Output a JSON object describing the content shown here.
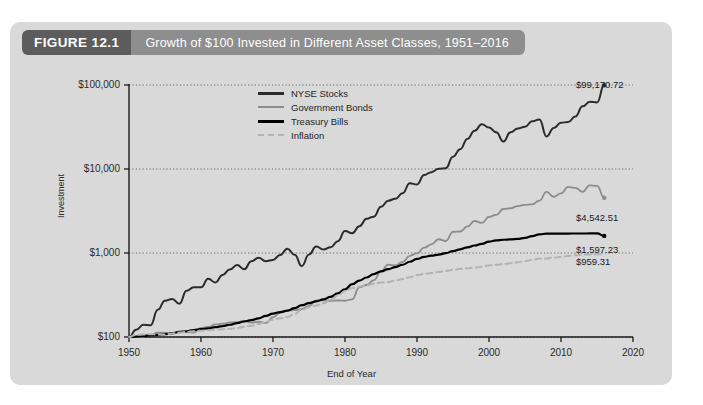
{
  "figure": {
    "number": "FIGURE 12.1",
    "title": "Growth of $100 Invested in Different Asset Classes, 1951–2016"
  },
  "chart_data": {
    "type": "line",
    "title": "Growth of $100 Invested in Different Asset Classes, 1951–2016",
    "xlabel": "End of Year",
    "ylabel": "Investment",
    "yscale": "log",
    "ylim": [
      100,
      100000
    ],
    "xlim": [
      1950,
      2020
    ],
    "grid": true,
    "legend_position": "upper-center",
    "y_ticks": [
      "$100",
      "$1,000",
      "$10,000",
      "$100,000"
    ],
    "y_tick_values": [
      100,
      1000,
      10000,
      100000
    ],
    "x_ticks": [
      "1950",
      "1960",
      "1970",
      "1980",
      "1990",
      "2000",
      "2010",
      "2020"
    ],
    "x_tick_values": [
      1950,
      1960,
      1970,
      1980,
      1990,
      2000,
      2010,
      2020
    ],
    "colors": {
      "nyse": "#2b2b2b",
      "bonds": "#8c8c8c",
      "bills": "#000000",
      "inflation": "#b3b3b3",
      "panel_background": "#d9d9d9",
      "header_number": "#5c5c5c",
      "header_title": "#8e8e8e"
    },
    "end_labels": [
      {
        "series": "NYSE Stocks",
        "text": "$99,170.72",
        "value": 99170.72
      },
      {
        "series": "Government Bonds",
        "text": "$4,542.51",
        "value": 4542.51
      },
      {
        "series": "Treasury Bills",
        "text": "$1,597.23",
        "value": 1597.23
      },
      {
        "series": "Inflation",
        "text": "$959.31",
        "value": 959.31
      }
    ],
    "x": [
      1950,
      1951,
      1952,
      1953,
      1954,
      1955,
      1956,
      1957,
      1958,
      1959,
      1960,
      1961,
      1962,
      1963,
      1964,
      1965,
      1966,
      1967,
      1968,
      1969,
      1970,
      1971,
      1972,
      1973,
      1974,
      1975,
      1976,
      1977,
      1978,
      1979,
      1980,
      1981,
      1982,
      1983,
      1984,
      1985,
      1986,
      1987,
      1988,
      1989,
      1990,
      1991,
      1992,
      1993,
      1994,
      1995,
      1996,
      1997,
      1998,
      1999,
      2000,
      2001,
      2002,
      2003,
      2004,
      2005,
      2006,
      2007,
      2008,
      2009,
      2010,
      2011,
      2012,
      2013,
      2014,
      2015,
      2016
    ],
    "series": [
      {
        "name": "NYSE Stocks",
        "color": "#2b2b2b",
        "style": "solid",
        "width": 2.0,
        "values": [
          100,
          122,
          140,
          138,
          211,
          271,
          283,
          249,
          355,
          392,
          390,
          492,
          446,
          549,
          637,
          718,
          641,
          796,
          880,
          798,
          828,
          947,
          1127,
          955,
          700,
          962,
          1194,
          1102,
          1171,
          1384,
          1827,
          1721,
          2085,
          2554,
          2707,
          3556,
          4202,
          4411,
          5151,
          6754,
          6536,
          8511,
          9175,
          10103,
          10226,
          14030,
          17207,
          22826,
          28500,
          34200,
          31100,
          27400,
          21300,
          27400,
          30400,
          31900,
          36900,
          38900,
          24400,
          30800,
          35500,
          36300,
          42100,
          55700,
          63200,
          62000,
          99170.72
        ]
      },
      {
        "name": "Government Bonds",
        "color": "#8c8c8c",
        "style": "solid",
        "width": 1.8,
        "values": [
          100,
          100,
          102,
          106,
          113,
          113,
          108,
          116,
          114,
          113,
          128,
          132,
          141,
          144,
          149,
          150,
          156,
          148,
          152,
          146,
          172,
          194,
          205,
          209,
          215,
          234,
          272,
          273,
          270,
          272,
          270,
          281,
          391,
          416,
          474,
          605,
          727,
          712,
          781,
          925,
          989,
          1159,
          1269,
          1457,
          1389,
          1787,
          1804,
          2072,
          2403,
          2283,
          2686,
          2846,
          3342,
          3412,
          3622,
          3748,
          3793,
          4213,
          5331,
          4674,
          5129,
          6142,
          5957,
          5353,
          6394,
          6307,
          4542.51
        ]
      },
      {
        "name": "Treasury Bills",
        "color": "#000000",
        "style": "solid",
        "width": 2.2,
        "values": [
          100,
          101,
          103,
          105,
          106,
          108,
          111,
          115,
          117,
          121,
          124,
          127,
          131,
          135,
          140,
          146,
          153,
          159,
          167,
          178,
          190,
          198,
          206,
          221,
          239,
          253,
          266,
          280,
          300,
          331,
          370,
          425,
          470,
          511,
          561,
          605,
          643,
          678,
          725,
          787,
          849,
          897,
          929,
          957,
          996,
          1052,
          1107,
          1166,
          1228,
          1286,
          1363,
          1415,
          1438,
          1453,
          1470,
          1516,
          1589,
          1664,
          1700,
          1703,
          1704,
          1705,
          1706,
          1707,
          1708,
          1709,
          1597.23
        ]
      },
      {
        "name": "Inflation",
        "color": "#b3b3b3",
        "style": "dashed",
        "width": 2.0,
        "values": [
          100,
          106,
          107,
          108,
          107,
          107,
          110,
          113,
          115,
          117,
          119,
          120,
          122,
          124,
          125,
          128,
          132,
          136,
          143,
          152,
          161,
          167,
          173,
          188,
          211,
          226,
          237,
          253,
          276,
          312,
          352,
          383,
          398,
          413,
          429,
          446,
          451,
          471,
          491,
          514,
          546,
          563,
          579,
          595,
          611,
          627,
          648,
          659,
          670,
          688,
          712,
          723,
          740,
          753,
          777,
          804,
          825,
          860,
          860,
          883,
          896,
          923,
          939,
          954,
          961,
          968,
          959.31
        ]
      }
    ]
  },
  "legend": {
    "items": [
      {
        "label": "NYSE Stocks",
        "color": "#2b2b2b",
        "style": "solid",
        "thickness": "3px"
      },
      {
        "label": "Government Bonds",
        "color": "#8c8c8c",
        "style": "solid",
        "thickness": "2.5px"
      },
      {
        "label": "Treasury Bills",
        "color": "#000000",
        "style": "solid",
        "thickness": "3.5px"
      },
      {
        "label": "Inflation",
        "color": "#b3b3b3",
        "style": "dashed",
        "thickness": "2px"
      }
    ]
  }
}
